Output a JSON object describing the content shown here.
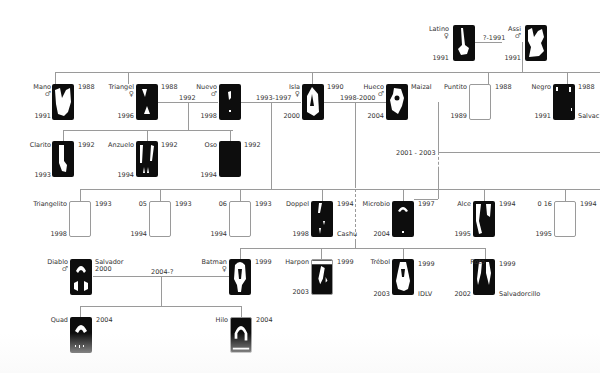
{
  "diagram": {
    "type": "family-tree",
    "colors": {
      "line": "#9a9a9a",
      "card_dark": "#0d0d0d",
      "text": "#333333"
    },
    "members": [
      {
        "id": "latino",
        "name": "Latino",
        "sex": "♀",
        "born": "",
        "year_bottom": "1991"
      },
      {
        "id": "assi",
        "name": "Assi",
        "sex": "♂",
        "born": "",
        "year_bottom": "1991"
      },
      {
        "id": "mano",
        "name": "Mano",
        "sex": "♂",
        "born": "1988",
        "year_bottom": "1991"
      },
      {
        "id": "triangel",
        "name": "Triangel",
        "sex": "♀",
        "born": "1988",
        "year_bottom": "1996"
      },
      {
        "id": "nuevo",
        "name": "Nuevo",
        "sex": "♂",
        "born": "",
        "year_bottom": "1998"
      },
      {
        "id": "isla",
        "name": "Isla",
        "sex": "♀",
        "born": "1990",
        "year_bottom": "2000"
      },
      {
        "id": "hueco",
        "name": "Hueco",
        "sex": "♂",
        "born": "",
        "year_bottom": "2004",
        "note": "Maizal"
      },
      {
        "id": "puntito",
        "name": "Puntito",
        "sex": "",
        "born": "1988",
        "year_bottom": "1989"
      },
      {
        "id": "negro",
        "name": "Negro",
        "sex": "",
        "born": "1988",
        "year_bottom": "1991",
        "note": "Salvac"
      },
      {
        "id": "clarito",
        "name": "Clarito",
        "sex": "",
        "born": "1992",
        "year_bottom": "1993"
      },
      {
        "id": "anzuelo",
        "name": "Anzuelo",
        "sex": "",
        "born": "1992",
        "year_bottom": "1994"
      },
      {
        "id": "oso",
        "name": "Oso",
        "sex": "",
        "born": "1992",
        "year_bottom": "1994"
      },
      {
        "id": "triangelito",
        "name": "Triangelito",
        "sex": "",
        "born": "1993",
        "year_bottom": "1998"
      },
      {
        "id": "n05",
        "name": "05",
        "sex": "",
        "born": "1993",
        "year_bottom": "1994"
      },
      {
        "id": "n06",
        "name": "06",
        "sex": "",
        "born": "1993",
        "year_bottom": "1994"
      },
      {
        "id": "doppel",
        "name": "Doppel",
        "sex": "",
        "born": "1994",
        "year_bottom": "1998",
        "note": "Cashu"
      },
      {
        "id": "microbio",
        "name": "Microbio",
        "sex": "",
        "born": "1997",
        "year_bottom": "2004"
      },
      {
        "id": "alce",
        "name": "Alce",
        "sex": "",
        "born": "1994",
        "year_bottom": "1995"
      },
      {
        "id": "n016",
        "name": "0 16",
        "sex": "",
        "born": "1994",
        "year_bottom": "1995"
      },
      {
        "id": "diablo",
        "name": "Diablo",
        "sex": "♂",
        "born": "",
        "year_bottom": "",
        "note": "Salvador 2000"
      },
      {
        "id": "batman",
        "name": "Batman",
        "sex": "♀",
        "born": "1999",
        "year_bottom": ""
      },
      {
        "id": "harpon",
        "name": "Harpon",
        "sex": "",
        "born": "1999",
        "year_bottom": "2003"
      },
      {
        "id": "trebol",
        "name": "Trébol",
        "sex": "",
        "born": "1999",
        "year_bottom": "2003",
        "note": "IDLV"
      },
      {
        "id": "roto",
        "name": "Roto",
        "sex": "",
        "born": "1999",
        "year_bottom": "2002",
        "note": "Salvadorcillo"
      },
      {
        "id": "quad",
        "name": "Quad",
        "sex": "",
        "born": "2004",
        "year_bottom": ""
      },
      {
        "id": "hilo",
        "name": "Hilo",
        "sex": "",
        "born": "2004",
        "year_bottom": ""
      }
    ],
    "unions": [
      {
        "id": "latino-assi",
        "label": "?-1991"
      },
      {
        "id": "triangel-nuevo",
        "label": "1992"
      },
      {
        "id": "nuevo-isla",
        "label": "1993-1997"
      },
      {
        "id": "isla-hueco",
        "label": "1998-2000"
      },
      {
        "id": "hueco-other",
        "label": "2001 - 2003"
      },
      {
        "id": "diablo-batman",
        "label": "2004-?"
      }
    ]
  }
}
